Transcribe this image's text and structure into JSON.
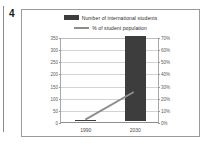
{
  "figure": {
    "number": "4"
  },
  "chart_data": {
    "type": "bar",
    "title": "",
    "categories": [
      "1990",
      "2030"
    ],
    "series": [
      {
        "name": "Number of international students",
        "type": "bar",
        "axis": "left",
        "values": [
          5,
          350
        ],
        "color": "#3d3d3d"
      },
      {
        "name": "% of student population",
        "type": "line",
        "axis": "right",
        "values": [
          2,
          25
        ],
        "color": "#8d8d8d"
      }
    ],
    "xlabel": "",
    "ylabel": "",
    "ylim": [
      0,
      350
    ],
    "y2lim": [
      0,
      70
    ],
    "yticks": [
      "0",
      "50",
      "100",
      "150",
      "200",
      "250",
      "300",
      "350"
    ],
    "ytick_values": [
      0,
      50,
      100,
      150,
      200,
      250,
      300,
      350
    ],
    "y2ticks": [
      "0%",
      "10%",
      "20%",
      "30%",
      "40%",
      "50%",
      "60%",
      "70%"
    ],
    "y2tick_values": [
      0,
      10,
      20,
      30,
      40,
      50,
      60,
      70
    ],
    "grid": true,
    "legend_position": "top"
  },
  "legend": {
    "items": [
      {
        "label": "Number of international students",
        "marker": "bar-swatch"
      },
      {
        "label": "% of student population",
        "marker": "line-swatch"
      }
    ]
  },
  "colors": {
    "bar": "#3d3d3d",
    "line": "#8d8d8d",
    "grid": "#d3d3d3",
    "frame": "#9a9a9a",
    "text": "#4a4a4a"
  }
}
